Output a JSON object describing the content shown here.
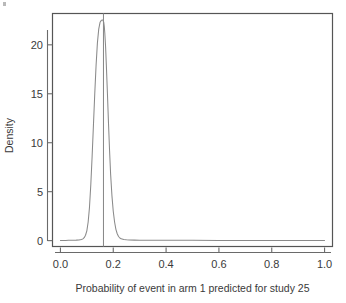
{
  "chart_data": {
    "type": "line",
    "title": "",
    "subtitle": "",
    "xlabel": "Probability of event in arm 1 predicted for study 25",
    "ylabel": "Density",
    "xlim": [
      -0.03,
      1.03
    ],
    "ylim": [
      -0.6,
      23.2
    ],
    "xticks": [
      0.0,
      0.2,
      0.4,
      0.6,
      0.8,
      1.0
    ],
    "xtick_labels": [
      "0.0",
      "0.2",
      "0.4",
      "0.6",
      "0.8",
      "1.0"
    ],
    "yticks": [
      0,
      5,
      10,
      15,
      20
    ],
    "ytick_labels": [
      "0",
      "5",
      "10",
      "15",
      "20"
    ],
    "grid": false,
    "legend": false,
    "legend_position": "none",
    "frame": "box",
    "series": [
      {
        "name": "Posterior predictive density",
        "color": "#8a8a8a",
        "x": [
          0.0,
          0.01,
          0.02,
          0.03,
          0.04,
          0.05,
          0.06,
          0.07,
          0.08,
          0.085,
          0.09,
          0.095,
          0.1,
          0.105,
          0.11,
          0.115,
          0.12,
          0.125,
          0.13,
          0.135,
          0.14,
          0.145,
          0.15,
          0.155,
          0.158,
          0.161,
          0.164,
          0.166,
          0.168,
          0.171,
          0.174,
          0.178,
          0.182,
          0.186,
          0.19,
          0.195,
          0.2,
          0.205,
          0.21,
          0.215,
          0.22,
          0.225,
          0.23,
          0.24,
          0.25,
          0.26,
          0.28,
          0.3,
          0.35,
          0.4,
          0.5,
          0.6,
          0.7,
          0.8,
          0.9,
          1.0
        ],
        "y": [
          0.02,
          0.02,
          0.02,
          0.03,
          0.03,
          0.04,
          0.05,
          0.07,
          0.12,
          0.18,
          0.3,
          0.55,
          1.0,
          1.9,
          3.4,
          5.7,
          8.6,
          11.8,
          15.0,
          17.9,
          20.2,
          21.6,
          22.3,
          22.5,
          22.55,
          22.5,
          22.3,
          21.9,
          21.2,
          19.8,
          17.8,
          15.0,
          12.0,
          9.2,
          6.8,
          4.6,
          3.0,
          1.9,
          1.15,
          0.7,
          0.42,
          0.27,
          0.18,
          0.11,
          0.08,
          0.06,
          0.05,
          0.04,
          0.03,
          0.03,
          0.03,
          0.02,
          0.02,
          0.02,
          0.02,
          0.02
        ]
      }
    ],
    "annotations": [
      {
        "name": "observed-value-reference-line",
        "type": "vline",
        "x": 0.163,
        "color": "#8a8a8a",
        "label": ""
      }
    ],
    "peak": {
      "x": 0.163,
      "y": 22.55
    }
  }
}
